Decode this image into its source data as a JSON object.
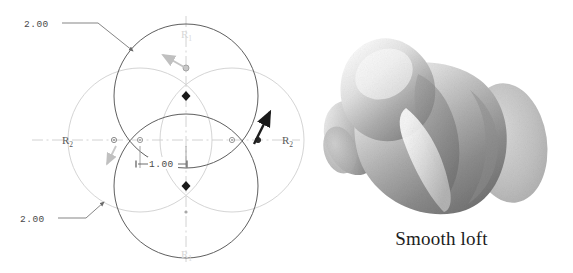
{
  "figure": {
    "panels": [
      {
        "id": "sketch",
        "name": "parametric-sketch",
        "type": "2d-cad-sketch"
      },
      {
        "id": "model",
        "name": "shaded-3d-loft",
        "type": "3d-shaded-solid",
        "caption": "Smooth loft"
      }
    ]
  },
  "sketch": {
    "dimensions": [
      {
        "key": "upper_diameter",
        "label": "2.00",
        "leader": "upper-left"
      },
      {
        "key": "lower_diameter",
        "label": "2.00",
        "leader": "lower-left"
      },
      {
        "key": "center_spacing",
        "label": "1.00",
        "leader": "center"
      }
    ],
    "radius_labels": {
      "left": "R",
      "left_sub": "2",
      "right": "R",
      "right_sub": "2",
      "top": "R",
      "top_sub": "1",
      "bottom": "R",
      "bottom_sub": "1"
    },
    "geometry": {
      "circle_count": 4,
      "arrangement": "clover",
      "dark_circles": [
        "top",
        "bottom"
      ],
      "light_circles": [
        "left",
        "right"
      ],
      "center_markers": [
        "diamond-up",
        "diamond-down"
      ],
      "axis_markers": [
        "node-left",
        "node-mid-left",
        "node-mid-right",
        "node-right"
      ]
    },
    "arrows": [
      {
        "key": "upper_handle",
        "tone": "light",
        "direction": "up-left"
      },
      {
        "key": "lower_handle",
        "tone": "light",
        "direction": "down-left"
      },
      {
        "key": "right_handle",
        "tone": "dark",
        "direction": "up-right"
      }
    ]
  },
  "colors": {
    "dark_arc": "#5a5a5a",
    "light_arc": "#cccccc",
    "centerline": "#bdbdbd",
    "dim_text": "#4a4a4a",
    "marker": "#1a1a1a",
    "caption": "#1d1d1d",
    "model_light": "#f2f2f2",
    "model_mid": "#b4b4b4",
    "model_dark": "#6e6e6e",
    "background": "#ffffff"
  }
}
